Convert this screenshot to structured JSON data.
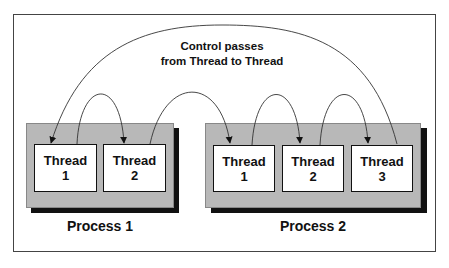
{
  "caption": {
    "line1": "Control passes",
    "line2": "from Thread to Thread"
  },
  "processes": [
    {
      "label": "Process 1",
      "threads": [
        {
          "title": "Thread",
          "number": "1"
        },
        {
          "title": "Thread",
          "number": "2"
        }
      ]
    },
    {
      "label": "Process 2",
      "threads": [
        {
          "title": "Thread",
          "number": "1"
        },
        {
          "title": "Thread",
          "number": "2"
        },
        {
          "title": "Thread",
          "number": "3"
        }
      ]
    }
  ],
  "arrows": [
    {
      "from": "Process 1 / Thread 1",
      "to": "Process 1 / Thread 2"
    },
    {
      "from": "Process 1 / Thread 2",
      "to": "Process 2 / Thread 1"
    },
    {
      "from": "Process 2 / Thread 1",
      "to": "Process 2 / Thread 2"
    },
    {
      "from": "Process 2 / Thread 2",
      "to": "Process 2 / Thread 3"
    },
    {
      "from": "Process 2 / Thread 3",
      "to": "Process 1 / Thread 1"
    }
  ],
  "colors": {
    "process_fill": "#b8b8b8",
    "shadow": "#111111",
    "thread_fill": "#ffffff",
    "line": "#222222"
  }
}
